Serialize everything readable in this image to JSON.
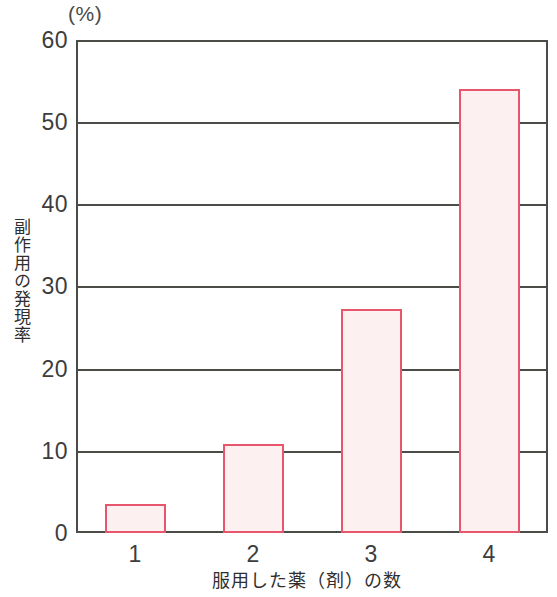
{
  "chart_data": {
    "type": "bar",
    "title": "",
    "subtitle": "",
    "unit_label": "(%)",
    "categories": [
      "1",
      "2",
      "3",
      "4"
    ],
    "values": [
      3.5,
      10.8,
      27.3,
      54.0
    ],
    "series": [
      {
        "name": "副作用の発現率",
        "values": [
          3.5,
          10.8,
          27.3,
          54.0
        ]
      }
    ],
    "xlabel": "服用した薬（剤）の数",
    "ylabel": "副作用の発現率",
    "ylim": [
      0,
      60
    ],
    "yticks": [
      "60",
      "50",
      "40",
      "30",
      "20",
      "10",
      "0"
    ],
    "ytick_values": [
      60,
      50,
      40,
      30,
      20,
      10,
      0
    ],
    "xticks": [
      "1",
      "2",
      "3",
      "4"
    ],
    "grid": true,
    "grid_axis": "y",
    "legend": "none",
    "colors": {
      "bar_stroke": "#e8566e",
      "bar_fill": "#fcf1f0",
      "axis": "#4b4b48",
      "text": "#3d3d3d"
    }
  },
  "axis": {
    "y_title": "副作用の発現率",
    "x_title": "服用した薬（剤）の数",
    "unit": "(%)"
  },
  "ytick_labels": {
    "t60": "60",
    "t50": "50",
    "t40": "40",
    "t30": "30",
    "t20": "20",
    "t10": "10",
    "t0": "0"
  },
  "xtick_labels": {
    "c1": "1",
    "c2": "2",
    "c3": "3",
    "c4": "4"
  }
}
